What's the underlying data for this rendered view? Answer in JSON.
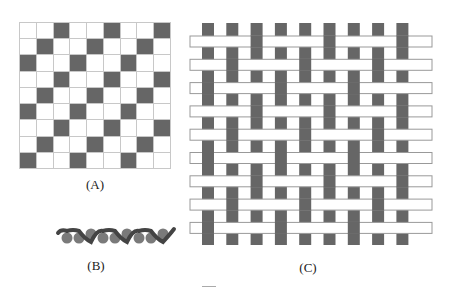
{
  "figure": {
    "panels": [
      {
        "id": "A",
        "label": "(A)",
        "description": "Weave pattern draft grid, 9x9, dark cells where warp is over weft"
      },
      {
        "id": "B",
        "label": "(B)",
        "description": "Cross-section of the woven fabric"
      },
      {
        "id": "C",
        "label": "(C)",
        "description": "Woven fabric with 9 warp strips and 9 weft strips"
      }
    ],
    "grid": {
      "rows": 9,
      "cols": 9,
      "pattern": [
        [
          0,
          0,
          1,
          0,
          0,
          1,
          0,
          0,
          1
        ],
        [
          0,
          1,
          0,
          0,
          1,
          0,
          0,
          1,
          0
        ],
        [
          1,
          0,
          0,
          1,
          0,
          0,
          1,
          0,
          0
        ],
        [
          0,
          0,
          1,
          0,
          0,
          1,
          0,
          0,
          1
        ],
        [
          0,
          1,
          0,
          0,
          1,
          0,
          0,
          1,
          0
        ],
        [
          1,
          0,
          0,
          1,
          0,
          0,
          1,
          0,
          0
        ],
        [
          0,
          0,
          1,
          0,
          0,
          1,
          0,
          0,
          1
        ],
        [
          0,
          1,
          0,
          0,
          1,
          0,
          0,
          1,
          0
        ],
        [
          1,
          0,
          0,
          1,
          0,
          0,
          1,
          0,
          0
        ]
      ]
    },
    "colors": {
      "dark": "#666666",
      "grid_line": "#c8c8c8",
      "weft_outline": "#999999",
      "yarn_circle": "#7a7a7a",
      "wave": "#444444"
    }
  }
}
